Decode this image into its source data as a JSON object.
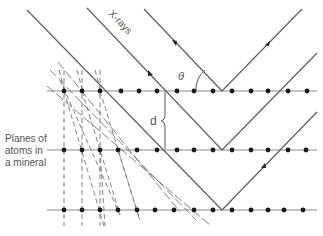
{
  "diagram": {
    "labels": {
      "xrays": "X-rays",
      "theta": "θ",
      "d": "d",
      "planes_line1": "Planes of",
      "planes_line2": "atoms in",
      "planes_line3": "a mineral"
    },
    "colors": {
      "line": "#5a5a5a",
      "dot": "#1a1a1a",
      "text": "#555555",
      "background": "#ffffff"
    },
    "planes": [
      {
        "y": 91,
        "atom_x": [
          64,
          82,
          100,
          121,
          139,
          157,
          177,
          194,
          213,
          232,
          251,
          268,
          288,
          307
        ]
      },
      {
        "y": 150,
        "atom_x": [
          64,
          82,
          100,
          118,
          137,
          157,
          177,
          194,
          213,
          232,
          251,
          268,
          288,
          306
        ]
      },
      {
        "y": 210,
        "atom_x": [
          64,
          82,
          100,
          118,
          137,
          155,
          174,
          194,
          213,
          232,
          251,
          268,
          284,
          303
        ]
      }
    ],
    "rays": [
      {
        "name": "ray-1",
        "incident_from": [
          144,
          9
        ],
        "reflect_at": [
          222,
          91
        ],
        "reflected_to": [
          302,
          9
        ]
      },
      {
        "name": "ray-2",
        "incident_from": [
          87,
          8
        ],
        "reflect_at": [
          222,
          150
        ],
        "reflected_to": [
          317,
          53
        ]
      },
      {
        "name": "ray-3",
        "incident_from": [
          27,
          10
        ],
        "reflect_at": [
          222,
          210
        ],
        "reflected_to": [
          317,
          112
        ]
      }
    ]
  }
}
